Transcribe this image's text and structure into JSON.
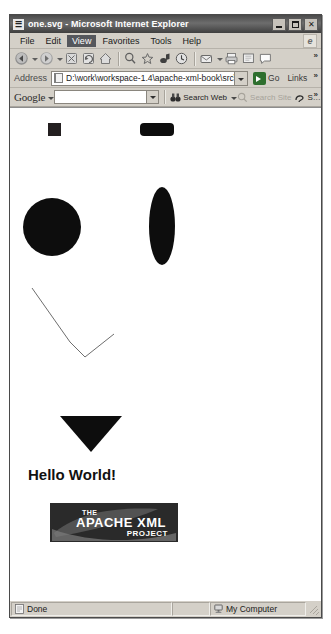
{
  "window": {
    "title": "one.svg - Microsoft Internet Explorer",
    "icon": "svg-document-icon",
    "minimize_label": "Minimize",
    "maximize_label": "Maximize",
    "close_label": "✕"
  },
  "menubar": {
    "items": [
      {
        "label": "File",
        "active": false
      },
      {
        "label": "Edit",
        "active": false
      },
      {
        "label": "View",
        "active": true
      },
      {
        "label": "Favorites",
        "active": false
      },
      {
        "label": "Tools",
        "active": false
      },
      {
        "label": "Help",
        "active": false
      }
    ]
  },
  "toolbar": {
    "buttons": [
      "back-icon",
      "forward-icon",
      "stop-icon",
      "refresh-icon",
      "home-icon",
      "search-icon",
      "favorites-star-icon",
      "media-icon",
      "history-icon",
      "mail-icon",
      "print-icon",
      "edit-icon",
      "discuss-icon"
    ],
    "overflow_label": "»"
  },
  "address": {
    "label": "Address",
    "value": "D:\\work\\workspace-1.4\\apache-xml-book\\src\\com\\sauri",
    "placeholder": "Type a web address",
    "go_label": "Go",
    "links_label": "Links",
    "overflow_label": "»"
  },
  "google_toolbar": {
    "brand": "Google",
    "search_value": "",
    "search_placeholder": "",
    "search_web_label": "Search Web",
    "search_site_label": "Search Site",
    "extra_label": "S…",
    "overflow_label": "»"
  },
  "content": {
    "svg_title": "one.svg",
    "shapes": [
      {
        "name": "rect-square",
        "type": "rect",
        "x": 38,
        "y": 15,
        "width": 13,
        "height": 13,
        "fill": "#231f20"
      },
      {
        "name": "rounded-rect",
        "type": "rect",
        "x": 130,
        "y": 15,
        "width": 34,
        "height": 13,
        "rx": 4,
        "fill": "#0d0d0d"
      },
      {
        "name": "circle",
        "type": "circle",
        "cx": 42,
        "cy": 119,
        "r": 29,
        "fill": "#0d0d0d"
      },
      {
        "name": "ellipse",
        "type": "ellipse",
        "cx": 152,
        "cy": 118,
        "rx": 13,
        "ry": 39,
        "fill": "#0d0d0d"
      },
      {
        "name": "polyline",
        "type": "polyline",
        "points": "22,180 60,234 75,249 104,226",
        "stroke": "#6e6e6e",
        "stroke_width": 1,
        "fill": "none"
      },
      {
        "name": "triangle",
        "type": "polygon",
        "points": "50,308 112,308 81,344",
        "fill": "#0d0d0d"
      }
    ],
    "text": {
      "value": "Hello World!",
      "x": 18,
      "y": 372,
      "font_size": 15,
      "color": "#111111"
    },
    "image": {
      "name": "apache-xml-project-logo",
      "x": 40,
      "y": 395,
      "width": 128,
      "height": 39,
      "line1": "THE",
      "line2": "APACHE XML",
      "line3": "PROJECT",
      "background": "#2a2a2a",
      "text_color": "#ffffff"
    }
  },
  "statusbar": {
    "status": "Done",
    "status_icon": "page-icon",
    "zone": "My Computer",
    "zone_icon": "my-computer-icon"
  },
  "colors": {
    "window_chrome": "#d4d0c8",
    "titlebar": "#4a4a4a",
    "canvas": "#ffffff",
    "shape_fill": "#0d0d0d",
    "menu_highlight": "#55575c"
  }
}
